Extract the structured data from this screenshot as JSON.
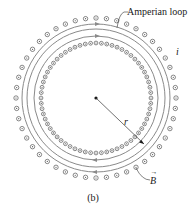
{
  "figure": {
    "caption": "(b)",
    "labels": {
      "amperian_loop": "Amperian loop",
      "current": "i",
      "radius": "r",
      "field": "B",
      "field_vector_arrow": "→"
    },
    "geometry": {
      "center": [
        96,
        98
      ],
      "outer_winding_radius": 80,
      "outer_winding_count": 48,
      "inner_winding_radius": 55,
      "inner_winding_count": 64,
      "field_line_radii": [
        74,
        69,
        62
      ],
      "amperian_loop_radius": 69
    },
    "colors": {
      "winding": "#555555",
      "field_line": "#8a8a8a",
      "text": "#1a1a1a"
    }
  }
}
